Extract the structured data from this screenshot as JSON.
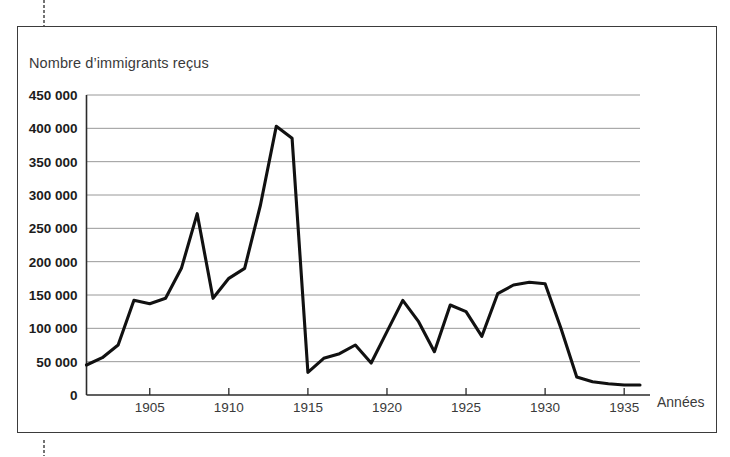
{
  "figure": {
    "title": "Nombre d’immigrants reçus",
    "x_axis_name": "Années",
    "border_color": "#3b3b3b",
    "line_color": "#111111",
    "grid_color": "#8d8d8d"
  },
  "chart_data": {
    "type": "line",
    "title": "Nombre d’immigrants reçus",
    "xlabel": "Années",
    "ylabel": "Nombre d’immigrants reçus",
    "xlim": [
      1901,
      1936
    ],
    "ylim": [
      0,
      450000
    ],
    "grid": true,
    "legend": "none",
    "y_ticks": [
      0,
      50000,
      100000,
      150000,
      200000,
      250000,
      300000,
      350000,
      400000,
      450000
    ],
    "y_tick_labels": [
      "0",
      "50 000",
      "100 000",
      "150 000",
      "200 000",
      "250 000",
      "300 000",
      "350 000",
      "400 000",
      "450 000"
    ],
    "x_ticks": [
      1905,
      1910,
      1915,
      1920,
      1925,
      1930,
      1935
    ],
    "x_tick_labels": [
      "1905",
      "1910",
      "1915",
      "1920",
      "1925",
      "1930",
      "1935"
    ],
    "x": [
      1901,
      1902,
      1903,
      1904,
      1905,
      1906,
      1907,
      1908,
      1909,
      1910,
      1911,
      1912,
      1913,
      1914,
      1915,
      1916,
      1917,
      1918,
      1919,
      1920,
      1921,
      1922,
      1923,
      1924,
      1925,
      1926,
      1927,
      1928,
      1929,
      1930,
      1931,
      1932,
      1933,
      1934,
      1935,
      1936
    ],
    "values": [
      45000,
      56000,
      75000,
      142000,
      137000,
      145000,
      190000,
      272000,
      145000,
      175000,
      190000,
      285000,
      403000,
      385000,
      34000,
      55000,
      62000,
      75000,
      48000,
      95000,
      142000,
      110000,
      65000,
      135000,
      125000,
      88000,
      152000,
      165000,
      169000,
      167000,
      100000,
      27000,
      20000,
      17000,
      15000,
      15000
    ],
    "series": [
      {
        "name": "Nombre d’immigrants reçus",
        "values": [
          45000,
          56000,
          75000,
          142000,
          137000,
          145000,
          190000,
          272000,
          145000,
          175000,
          190000,
          285000,
          403000,
          385000,
          34000,
          55000,
          62000,
          75000,
          48000,
          95000,
          142000,
          110000,
          65000,
          135000,
          125000,
          88000,
          152000,
          165000,
          169000,
          167000,
          100000,
          27000,
          20000,
          17000,
          15000,
          15000
        ]
      }
    ]
  }
}
